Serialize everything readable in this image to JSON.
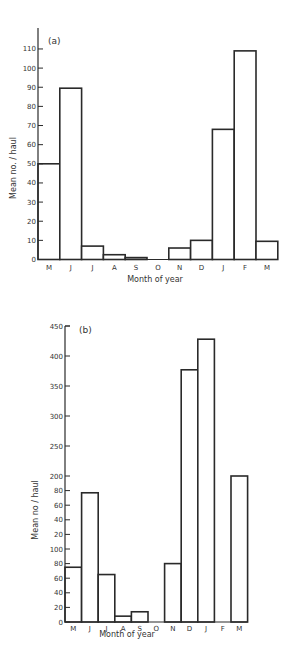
{
  "chart_data": [
    {
      "type": "bar",
      "panel_label": "(a)",
      "xlabel": "Month of year",
      "ylabel": "Mean no. / haul",
      "categories": [
        "M",
        "J",
        "J",
        "A",
        "S",
        "O",
        "N",
        "D",
        "J",
        "F",
        "M"
      ],
      "category_full": [
        "May",
        "Jun",
        "Jul",
        "Aug",
        "Sep",
        "Oct",
        "Nov",
        "Dec",
        "Jan",
        "Feb",
        "Mar"
      ],
      "values": [
        50,
        89.5,
        7,
        2.5,
        1,
        0,
        6,
        10,
        68,
        109,
        9.5
      ],
      "yticks": [
        0,
        10,
        20,
        30,
        40,
        50,
        60,
        70,
        80,
        90,
        100,
        110
      ],
      "ytick_labels": [
        "0",
        "10",
        "20",
        "30",
        "40",
        "50",
        "60",
        "70",
        "80",
        "90",
        "100",
        "110"
      ],
      "ylim": [
        0,
        120
      ],
      "grid": false,
      "legend": null
    },
    {
      "type": "bar",
      "panel_label": "(b)",
      "xlabel": "Month of year",
      "ylabel": "Mean no / haul",
      "categories": [
        "M",
        "J",
        "J",
        "A",
        "S",
        "O",
        "N",
        "D",
        "J",
        "F",
        "M"
      ],
      "category_full": [
        "May",
        "Jun",
        "Jul",
        "Aug",
        "Sep",
        "Oct",
        "Nov",
        "Dec",
        "Jan",
        "Feb",
        "Mar"
      ],
      "values": [
        75,
        177,
        65,
        8,
        14,
        0,
        80,
        377,
        428,
        0,
        200
      ],
      "yticks": [
        0,
        20,
        40,
        60,
        80,
        100,
        120,
        140,
        160,
        180,
        200,
        250,
        300,
        350,
        400,
        450
      ],
      "ytick_labels": [
        "0",
        "20",
        "40",
        "60",
        "80",
        "100",
        "20",
        "40",
        "60",
        "80",
        "200",
        "250",
        "300",
        "350",
        "400",
        "450"
      ],
      "ylim": [
        0,
        450
      ],
      "axis_note": "Non-linear y-axis: 0-200 in steps of 20, 200-450 in steps of 50 (compressed upper scale)",
      "grid": false,
      "legend": null
    }
  ]
}
